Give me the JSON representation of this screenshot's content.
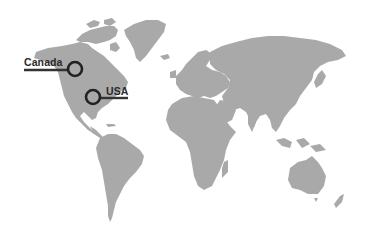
{
  "map": {
    "type": "world-map",
    "land_color": "#a9a9a9",
    "background_color": "#ffffff",
    "marker_color": "#222222"
  },
  "markers": [
    {
      "label": "Canada",
      "cx": 75,
      "cy": 69,
      "r": 7
    },
    {
      "label": "USA",
      "cx": 93,
      "cy": 97,
      "r": 7
    }
  ]
}
